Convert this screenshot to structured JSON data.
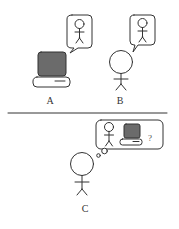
{
  "diagram": {
    "panels": [
      {
        "id": "A",
        "label": "A",
        "entity": "computer",
        "thought": "person"
      },
      {
        "id": "B",
        "label": "B",
        "entity": "person",
        "thought": "person"
      },
      {
        "id": "C",
        "label": "C",
        "entity": "person",
        "thought": [
          "person",
          "computer",
          "?"
        ]
      }
    ],
    "question_mark": "?",
    "colors": {
      "stroke": "#333333",
      "monitor_fill": "#6b6b6b",
      "background": "#ffffff"
    }
  }
}
